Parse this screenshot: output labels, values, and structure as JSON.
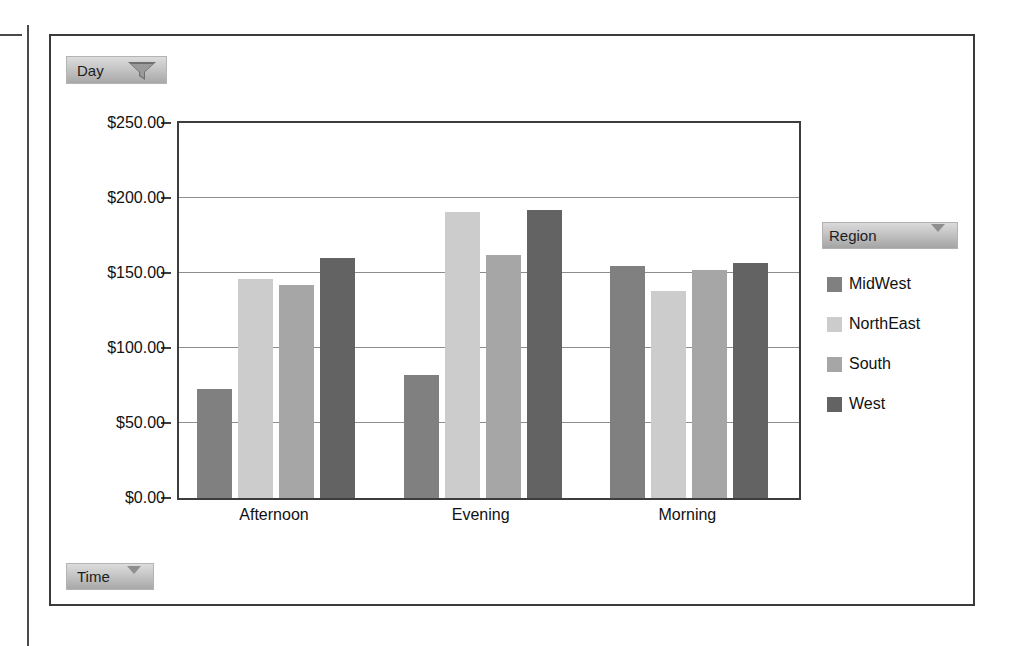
{
  "filters": {
    "day": {
      "label": "Day",
      "icon": "filter-funnel-icon"
    },
    "time": {
      "label": "Time",
      "icon": "chevron-down-icon"
    }
  },
  "legend": {
    "header_label": "Region",
    "header_icon": "chevron-down-icon",
    "items": [
      {
        "label": "MidWest",
        "color": "#808080"
      },
      {
        "label": "NorthEast",
        "color": "#cccccc"
      },
      {
        "label": "South",
        "color": "#a6a6a6"
      },
      {
        "label": "West",
        "color": "#636363"
      }
    ]
  },
  "chart_data": {
    "type": "bar",
    "title": "",
    "xlabel": "",
    "ylabel": "",
    "categories": [
      "Afternoon",
      "Evening",
      "Morning"
    ],
    "series": [
      {
        "name": "MidWest",
        "color": "#808080",
        "values": [
          73,
          82,
          155
        ]
      },
      {
        "name": "NorthEast",
        "color": "#cccccc",
        "values": [
          146,
          191,
          138
        ]
      },
      {
        "name": "South",
        "color": "#a6a6a6",
        "values": [
          142,
          162,
          152
        ]
      },
      {
        "name": "West",
        "color": "#636363",
        "values": [
          160,
          192,
          157
        ]
      }
    ],
    "ylim": [
      0,
      250
    ],
    "ytick_values": [
      0,
      50,
      100,
      150,
      200,
      250
    ],
    "ytick_labels": [
      "$0.00",
      "$50.00",
      "$100.00",
      "$150.00",
      "$200.00",
      "$250.00"
    ],
    "grid": true,
    "grid_axis": "y",
    "legend_position": "right",
    "currency": "USD"
  }
}
